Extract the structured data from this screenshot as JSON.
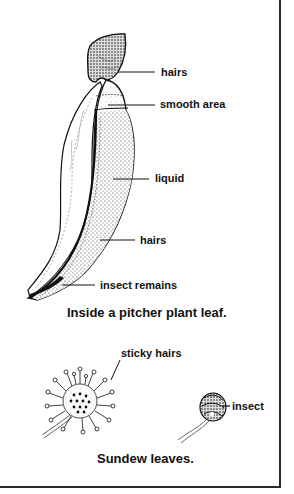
{
  "figure": {
    "pitcher": {
      "caption": "Inside a pitcher plant leaf.",
      "labels": {
        "hairs_top": "hairs",
        "smooth_area": "smooth area",
        "liquid": "liquid",
        "hairs_bottom": "hairs",
        "insect_remains": "insect remains"
      }
    },
    "sundew": {
      "caption": "Sundew leaves.",
      "labels": {
        "sticky_hairs": "sticky hairs",
        "insect": "insect"
      }
    }
  },
  "colors": {
    "ink": "#111111",
    "border": "#2a2a2a",
    "background": "#ffffff"
  }
}
